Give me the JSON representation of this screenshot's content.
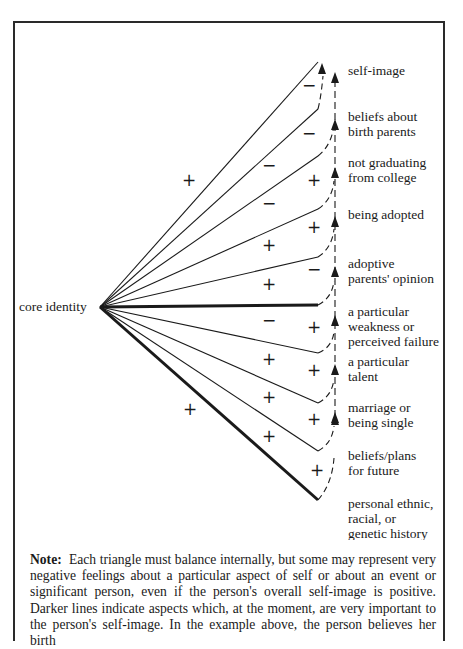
{
  "diagram": {
    "title": "core identity",
    "apex": {
      "x": 100,
      "y": 307
    },
    "branches": [
      {
        "id": "self-image",
        "label_lines": [
          "self-image"
        ],
        "end": {
          "x": 318,
          "y": 62
        },
        "bold": false,
        "outer_sign": "+",
        "arrow_y": 70
      },
      {
        "id": "beliefs-birth-parents",
        "label_lines": [
          "beliefs about",
          "birth parents"
        ],
        "end": {
          "x": 318,
          "y": 109
        },
        "bold": false,
        "outer_sign": "−",
        "arrow_y": 118
      },
      {
        "id": "not-graduating",
        "label_lines": [
          "not graduating",
          "from college"
        ],
        "end": {
          "x": 318,
          "y": 156
        },
        "bold": false,
        "outer_sign": "−",
        "arrow_y": 175
      },
      {
        "id": "being-adopted",
        "label_lines": [
          "being adopted"
        ],
        "end": {
          "x": 318,
          "y": 209
        },
        "bold": false,
        "outer_sign": "−",
        "arrow_y": 223
      },
      {
        "id": "adoptive-parents-opinion",
        "label_lines": [
          "adoptive",
          "parents' opinion"
        ],
        "end": {
          "x": 318,
          "y": 257
        },
        "bold": false,
        "outer_sign": "+",
        "arrow_y": 275
      },
      {
        "id": "particular-weakness",
        "label_lines": [
          "a particular",
          "weakness or",
          "perceived failure"
        ],
        "end": {
          "x": 318,
          "y": 305
        },
        "bold": true,
        "outer_sign": "+",
        "arrow_y": 326
      },
      {
        "id": "particular-talent",
        "label_lines": [
          "a particular",
          "talent"
        ],
        "end": {
          "x": 318,
          "y": 353
        },
        "bold": false,
        "outer_sign": "−",
        "arrow_y": 373
      },
      {
        "id": "marriage-single",
        "label_lines": [
          "marriage or",
          "being single"
        ],
        "end": {
          "x": 318,
          "y": 403
        },
        "bold": false,
        "outer_sign": "+",
        "arrow_y": 420
      },
      {
        "id": "beliefs-plans-future",
        "label_lines": [
          "beliefs/plans",
          "for future"
        ],
        "end": {
          "x": 318,
          "y": 451
        },
        "bold": false,
        "outer_sign": "+",
        "arrow_y": 452
      },
      {
        "id": "ethnic-history",
        "label_lines": [
          "personal ethnic,",
          "racial, or",
          "genetic history"
        ],
        "end": {
          "x": 318,
          "y": 500
        },
        "bold": true,
        "outer_sign": "+",
        "arrow_y": null
      }
    ],
    "signs": [
      {
        "text": "+",
        "x": 189,
        "y": 186
      },
      {
        "text": "−",
        "x": 309,
        "y": 91
      },
      {
        "text": "−",
        "x": 309,
        "y": 139
      },
      {
        "text": "−",
        "x": 269,
        "y": 171
      },
      {
        "text": "+",
        "x": 314,
        "y": 186
      },
      {
        "text": "−",
        "x": 269,
        "y": 209
      },
      {
        "text": "+",
        "x": 314,
        "y": 233
      },
      {
        "text": "+",
        "x": 269,
        "y": 251
      },
      {
        "text": "−",
        "x": 314,
        "y": 275
      },
      {
        "text": "+",
        "x": 269,
        "y": 290
      },
      {
        "text": "−",
        "x": 269,
        "y": 326
      },
      {
        "text": "+",
        "x": 314,
        "y": 333
      },
      {
        "text": "+",
        "x": 269,
        "y": 365
      },
      {
        "text": "+",
        "x": 314,
        "y": 376
      },
      {
        "text": "+",
        "x": 190,
        "y": 415
      },
      {
        "text": "+",
        "x": 269,
        "y": 403
      },
      {
        "text": "+",
        "x": 314,
        "y": 425
      },
      {
        "text": "+",
        "x": 269,
        "y": 442
      },
      {
        "text": "+",
        "x": 317,
        "y": 476
      }
    ],
    "labels": [
      {
        "lines": [
          "self-image"
        ],
        "x": 348,
        "y": 75
      },
      {
        "lines": [
          "beliefs about",
          "birth parents"
        ],
        "x": 348,
        "y": 121
      },
      {
        "lines": [
          "not graduating",
          "from college"
        ],
        "x": 348,
        "y": 167
      },
      {
        "lines": [
          "being adopted"
        ],
        "x": 348,
        "y": 219
      },
      {
        "lines": [
          "adoptive",
          "parents' opinion"
        ],
        "x": 348,
        "y": 268
      },
      {
        "lines": [
          "a particular",
          "weakness or",
          "perceived failure"
        ],
        "x": 348,
        "y": 316
      },
      {
        "lines": [
          "a particular",
          "talent"
        ],
        "x": 348,
        "y": 366
      },
      {
        "lines": [
          "marriage or",
          "being single"
        ],
        "x": 348,
        "y": 412
      },
      {
        "lines": [
          "beliefs/plans",
          "for future"
        ],
        "x": 348,
        "y": 460
      },
      {
        "lines": [
          "personal ethnic,",
          "racial, or",
          "genetic history"
        ],
        "x": 348,
        "y": 508
      }
    ]
  },
  "note": {
    "lead": "Note:",
    "text": "Each triangle must balance internally, but some may represent very negative feelings about a particular aspect of self or about an event or significant person, even if the person's overall self-image is positive. Darker lines indicate aspects which, at the moment, are very important to the person's self-image. In the example above, the person believes her birth"
  },
  "colors": {
    "ink": "#1a1a1a",
    "frame": "#2a2a2a",
    "background": "#ffffff"
  }
}
